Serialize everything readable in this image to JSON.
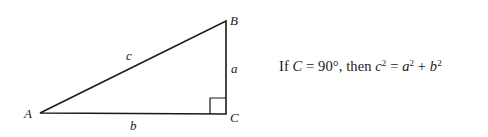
{
  "diagram": {
    "type": "right-triangle",
    "vertices": {
      "A": {
        "label": "A",
        "x": 40,
        "y": 113
      },
      "B": {
        "label": "B",
        "x": 226,
        "y": 21
      },
      "C": {
        "label": "C",
        "x": 226,
        "y": 114
      }
    },
    "sides": {
      "a": {
        "label": "a",
        "from": "B",
        "to": "C"
      },
      "b": {
        "label": "b",
        "from": "A",
        "to": "C"
      },
      "c": {
        "label": "c",
        "from": "A",
        "to": "B"
      }
    },
    "right_angle_at": "C",
    "line_color": "#1a1a1a"
  },
  "formula": {
    "prefix": "If ",
    "var_C": "C",
    "eq1": " = 90°, then ",
    "var_c": "c",
    "sup1": "2",
    "eq2": " = ",
    "var_a": "a",
    "sup2": "2",
    "plus": " + ",
    "var_b": "b",
    "sup3": "2",
    "full_text": "If C = 90°, then c² = a² + b²"
  }
}
